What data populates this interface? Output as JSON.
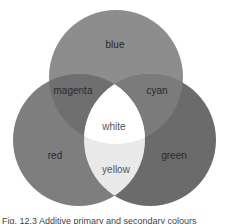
{
  "diagram": {
    "type": "venn",
    "circles": [
      {
        "id": "blue",
        "label": "blue",
        "cx": 116,
        "cy": 77,
        "r": 67,
        "fill": "#8d8d8d"
      },
      {
        "id": "red",
        "label": "red",
        "cx": 79,
        "cy": 140,
        "r": 66,
        "fill": "#7e7e7e"
      },
      {
        "id": "green",
        "label": "green",
        "cx": 150,
        "cy": 140,
        "r": 66,
        "fill": "#6b6b6b"
      }
    ],
    "regions": {
      "blue": "blue",
      "magenta": "magenta",
      "cyan": "cyan",
      "white": "white",
      "red": "red",
      "yellow": "yellow",
      "green": "green"
    },
    "region_colors": {
      "magenta": "#6f6f6f",
      "cyan": "#7b7b7b",
      "white": "#ffffff",
      "yellow": "#e9e9e9"
    }
  },
  "caption": {
    "text": "Fig. 12.3 Additive primary and secondary colours"
  }
}
